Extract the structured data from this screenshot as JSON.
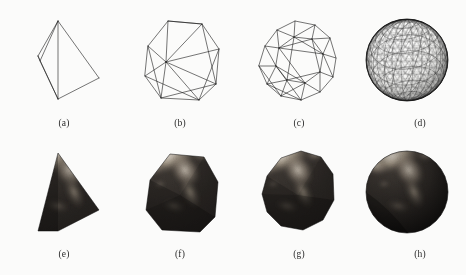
{
  "figure": {
    "background_color": "#fbfbfa",
    "stroke_color": "#1a1a1a",
    "caption_color": "#2a2a2a",
    "rows": [
      {
        "name": "wireframe-row",
        "description": "wireframe meshes"
      },
      {
        "name": "textured-row",
        "description": "earth texture-mapped meshes"
      }
    ],
    "panels": [
      {
        "id": "a",
        "label": "(a)",
        "kind": "wireframe",
        "shape": "tetrahedron",
        "faces": 4,
        "row": 0,
        "col": 0
      },
      {
        "id": "b",
        "label": "(b)",
        "kind": "wireframe",
        "shape": "subdivided-level-1",
        "faces": 16,
        "row": 0,
        "col": 1
      },
      {
        "id": "c",
        "label": "(c)",
        "kind": "wireframe",
        "shape": "subdivided-level-2",
        "faces": 64,
        "row": 0,
        "col": 2
      },
      {
        "id": "d",
        "label": "(d)",
        "kind": "wireframe",
        "shape": "sphere-dense",
        "faces": 1024,
        "row": 0,
        "col": 3
      },
      {
        "id": "e",
        "label": "(e)",
        "kind": "textured",
        "shape": "tetrahedron",
        "faces": 4,
        "row": 1,
        "col": 0
      },
      {
        "id": "f",
        "label": "(f)",
        "kind": "textured",
        "shape": "subdivided-level-1",
        "faces": 16,
        "row": 1,
        "col": 1
      },
      {
        "id": "g",
        "label": "(g)",
        "kind": "textured",
        "shape": "subdivided-level-2",
        "faces": 64,
        "row": 1,
        "col": 2
      },
      {
        "id": "h",
        "label": "(h)",
        "kind": "textured",
        "shape": "sphere-dense",
        "faces": 1024,
        "row": 1,
        "col": 3
      }
    ],
    "texture": {
      "name": "earth-satellite-texture",
      "ocean_color": "#241f1d",
      "land_color": "#8f8276",
      "cloud_color": "#d8d2c8",
      "shadow_color": "#100e0d"
    }
  }
}
